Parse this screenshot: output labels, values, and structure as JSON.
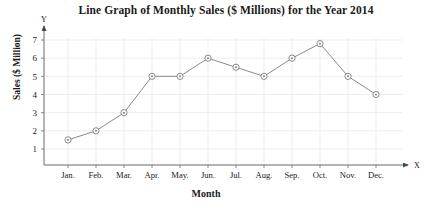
{
  "chart_data": {
    "type": "line",
    "title": "Line Graph of Monthly Sales ($ Millions) for the Year 2014",
    "xlabel": "Month",
    "ylabel": "Sales ($ Million)",
    "x_axis_letter": "X",
    "y_axis_letter": "Y",
    "categories": [
      "Jan.",
      "Feb.",
      "Mar.",
      "Apr.",
      "May.",
      "Jun.",
      "Jul.",
      "Aug.",
      "Sep.",
      "Oct.",
      "Nov.",
      "Dec."
    ],
    "values": [
      1.5,
      2.0,
      3.0,
      5.0,
      5.0,
      6.0,
      5.5,
      5.0,
      6.0,
      6.8,
      5.0,
      4.0
    ],
    "ytick_labels": [
      "1",
      "2",
      "3",
      "4",
      "5",
      "6",
      "7"
    ],
    "yticks": [
      1,
      2,
      3,
      4,
      5,
      6,
      7
    ],
    "ylim": [
      0,
      7.6
    ],
    "grid": true,
    "legend": false,
    "line_color": "#8a8a8a",
    "marker_color": "#7a7a7a",
    "grid_color": "#e8e8e8",
    "axis_color": "#6b6b6b",
    "series_name": "Monthly Sales"
  }
}
